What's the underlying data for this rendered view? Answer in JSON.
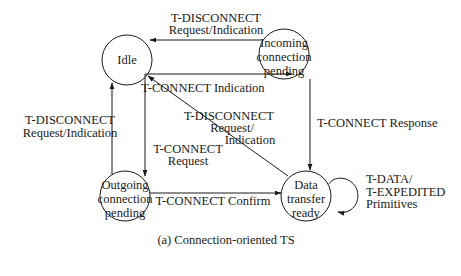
{
  "states": {
    "idle": {
      "label": [
        "Idle"
      ]
    },
    "incoming": {
      "label": [
        "Incoming",
        "connection",
        "pending"
      ]
    },
    "outgoing": {
      "label": [
        "Outgoing",
        "connection",
        "pending"
      ]
    },
    "data_transfer": {
      "label": [
        "Data",
        "transfer",
        "ready"
      ]
    }
  },
  "transitions": {
    "incoming_to_idle": {
      "line1": "T-DISCONNECT",
      "line2": "Request/Indication"
    },
    "idle_to_incoming": {
      "line1": "T-CONNECT Indication"
    },
    "outgoing_to_idle": {
      "line1": "T-DISCONNECT",
      "line2": "Request/Indication"
    },
    "idle_to_outgoing": {
      "line1": "T-CONNECT",
      "line2": "Request"
    },
    "data_to_idle": {
      "line1": "T-DISCONNECT",
      "line2": "Request/",
      "line3": "Indication"
    },
    "incoming_to_data": {
      "line1": "T-CONNECT Response"
    },
    "outgoing_to_data": {
      "line1": "T-CONNECT Confirm"
    },
    "data_self_loop": {
      "line1": "T-DATA/",
      "line2": "T-EXPEDITED",
      "line3": "Primitives"
    }
  },
  "caption": "(a) Connection-oriented TS",
  "colors": {
    "stroke": "#1a1a1a",
    "background": "#ffffff"
  }
}
